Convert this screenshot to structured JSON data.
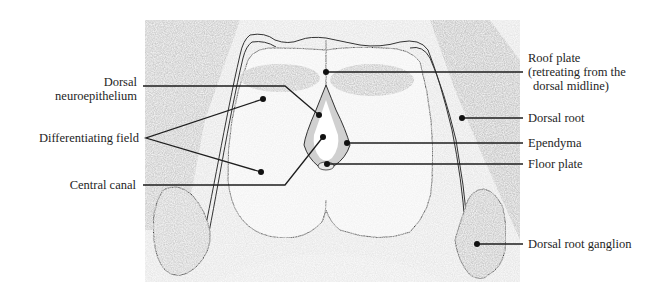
{
  "figure": {
    "labels_left": [
      {
        "id": "dorsal-neuroepithelium",
        "lines": [
          "Dorsal",
          "neuroepithelium"
        ]
      },
      {
        "id": "differentiating-field",
        "lines": [
          "Differentiating field"
        ]
      },
      {
        "id": "central-canal",
        "lines": [
          "Central canal"
        ]
      }
    ],
    "labels_right": [
      {
        "id": "roof-plate",
        "lines": [
          "Roof plate",
          "(retreating from the",
          "dorsal midline)"
        ]
      },
      {
        "id": "dorsal-root",
        "lines": [
          "Dorsal root"
        ]
      },
      {
        "id": "ependyma",
        "lines": [
          "Ependyma"
        ]
      },
      {
        "id": "floor-plate",
        "lines": [
          "Floor plate"
        ]
      },
      {
        "id": "dorsal-root-ganglion",
        "lines": [
          "Dorsal root ganglion"
        ]
      }
    ]
  },
  "colors": {
    "ink": "#1e1e1e",
    "tissue_light": "#eeeeee",
    "tissue_mid": "#d4d4d4",
    "tissue_dark": "#b8b8b8",
    "background": "#ffffff"
  }
}
